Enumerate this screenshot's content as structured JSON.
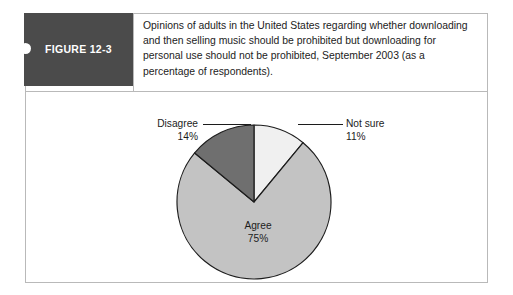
{
  "figure": {
    "tab_label": "FIGURE 12-3",
    "caption_lines": [
      "Opinions of adults in the United States regarding whether downloading",
      "and then selling music should be prohibited but downloading for",
      "personal use should not be prohibited, September 2003 (as a",
      "percentage of respondents)."
    ]
  },
  "chart_data": {
    "type": "pie",
    "title": "",
    "categories": [
      "Not sure",
      "Agree",
      "Disagree"
    ],
    "values": [
      11,
      75,
      14
    ],
    "value_labels": [
      "11%",
      "75%",
      "14%"
    ],
    "slice_colors": [
      "#f0f0f0",
      "#c3c3c3",
      "#6f6f6f"
    ],
    "stroke_color": "#1c1c1c",
    "start_angle_deg": 0,
    "direction": "clockwise",
    "legend": "none",
    "labels_inline": true,
    "units": "percentage of respondents",
    "annotations": [
      {
        "label": "Disagree",
        "value": "14%",
        "position": "left-leader"
      },
      {
        "label": "Not sure",
        "value": "11%",
        "position": "right-leader"
      },
      {
        "label": "Agree",
        "value": "75%",
        "position": "inside"
      }
    ]
  },
  "colors": {
    "tab_background": "#4b4b4b",
    "frame_border": "#b9b9b9",
    "text": "#1c1c1c",
    "page_background": "#ffffff"
  }
}
